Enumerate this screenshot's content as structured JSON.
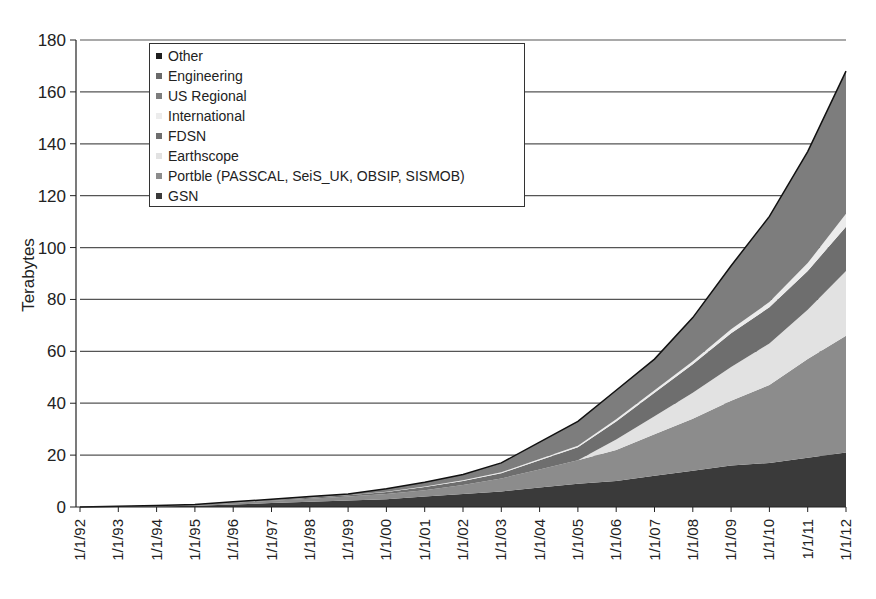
{
  "chart_data": {
    "type": "area",
    "stacked": true,
    "title": "",
    "xlabel": "",
    "ylabel": "Terabytes",
    "ylim": [
      0,
      180
    ],
    "yticks": [
      0,
      20,
      40,
      60,
      80,
      100,
      120,
      140,
      160,
      180
    ],
    "grid": true,
    "legend_position": "upper-left",
    "categories": [
      "1/1/92",
      "1/1/93",
      "1/1/94",
      "1/1/95",
      "1/1/96",
      "1/1/97",
      "1/1/98",
      "1/1/99",
      "1/1/00",
      "1/1/01",
      "1/1/02",
      "1/1/03",
      "1/1/04",
      "1/1/05",
      "1/1/06",
      "1/1/07",
      "1/1/08",
      "1/1/09",
      "1/1/10",
      "1/1/11",
      "1/1/12"
    ],
    "series": [
      {
        "name": "GSN",
        "color": "#3a3a3a",
        "values": [
          0,
          0.1,
          0.2,
          0.5,
          1,
          1.5,
          2,
          2.5,
          3,
          4,
          5,
          6,
          7.5,
          9,
          10,
          12,
          14,
          16,
          17,
          19,
          21
        ]
      },
      {
        "name": "Portble (PASSCAL, SeiS_UK, OBSIP, SISMOB)",
        "color": "#8c8c8c",
        "values": [
          0,
          0.1,
          0.2,
          0.3,
          0.6,
          0.9,
          1.2,
          1.5,
          2,
          2.5,
          3.5,
          5,
          7,
          9,
          12,
          16,
          20,
          25,
          30,
          38,
          45
        ]
      },
      {
        "name": "Earthscope",
        "color": "#e2e2e2",
        "values": [
          0,
          0,
          0,
          0,
          0,
          0,
          0,
          0,
          0,
          0,
          0,
          0,
          0,
          0,
          4,
          7,
          10,
          13,
          16,
          19,
          25
        ]
      },
      {
        "name": "FDSN",
        "color": "#6e6e6e",
        "values": [
          0,
          0,
          0.1,
          0.1,
          0.2,
          0.3,
          0.4,
          0.5,
          0.8,
          1.2,
          1.5,
          2,
          3.5,
          5,
          7,
          9,
          11,
          13,
          14,
          15,
          17
        ]
      },
      {
        "name": "International",
        "color": "#ececec",
        "values": [
          0,
          0,
          0,
          0,
          0,
          0,
          0,
          0,
          0.1,
          0.2,
          0.3,
          0.4,
          0.5,
          0.6,
          0.8,
          1,
          1.2,
          1.5,
          2,
          3,
          5
        ]
      },
      {
        "name": "US Regional",
        "color": "#7d7d7d",
        "values": [
          0,
          0.1,
          0.1,
          0.1,
          0.2,
          0.3,
          0.4,
          0.5,
          1.1,
          1.6,
          2.2,
          3.6,
          6.5,
          9.4,
          11.2,
          12,
          16.8,
          24.5,
          33,
          43,
          55
        ]
      },
      {
        "name": "Engineering",
        "color": "#6a6a6a",
        "values": [
          0,
          0,
          0,
          0,
          0,
          0,
          0,
          0,
          0,
          0,
          0,
          0,
          0,
          0,
          0,
          0,
          0,
          0,
          0,
          0,
          0
        ]
      },
      {
        "name": "Other",
        "color": "#1e1e1e",
        "values": [
          0,
          0,
          0,
          0,
          0,
          0,
          0,
          0,
          0,
          0,
          0,
          0,
          0,
          0,
          0,
          0,
          0,
          0,
          0,
          0,
          0
        ]
      }
    ],
    "totals": [
      0,
      0.3,
      0.6,
      1,
      2,
      3,
      4,
      5,
      7,
      9.5,
      12.5,
      17,
      25,
      33,
      45,
      57,
      73,
      93,
      112,
      137,
      168
    ],
    "annotations": [
      "spike near mid-2009 (~103 TB total)",
      "step increase at 1/1/06 where Earthscope begins"
    ]
  },
  "legend": {
    "items": [
      {
        "label": "Other",
        "color": "#1e1e1e"
      },
      {
        "label": "Engineering",
        "color": "#6a6a6a"
      },
      {
        "label": "US Regional",
        "color": "#7d7d7d"
      },
      {
        "label": "International",
        "color": "#ececec"
      },
      {
        "label": "FDSN",
        "color": "#6e6e6e"
      },
      {
        "label": "Earthscope",
        "color": "#e2e2e2"
      },
      {
        "label": "Portble (PASSCAL, SeiS_UK, OBSIP, SISMOB)",
        "color": "#8c8c8c"
      },
      {
        "label": "GSN",
        "color": "#3a3a3a"
      }
    ]
  },
  "axis": {
    "ylabel": "Terabytes",
    "ytick_labels": [
      "0",
      "20",
      "40",
      "60",
      "80",
      "100",
      "120",
      "140",
      "160",
      "180"
    ],
    "xtick_labels": [
      "1/1/92",
      "1/1/93",
      "1/1/94",
      "1/1/95",
      "1/1/96",
      "1/1/97",
      "1/1/98",
      "1/1/99",
      "1/1/00",
      "1/1/01",
      "1/1/02",
      "1/1/03",
      "1/1/04",
      "1/1/05",
      "1/1/06",
      "1/1/07",
      "1/1/08",
      "1/1/09",
      "1/1/10",
      "1/1/11",
      "1/1/12"
    ]
  }
}
